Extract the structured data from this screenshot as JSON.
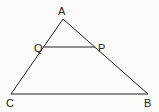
{
  "diagram": {
    "type": "triangle with parallel segment",
    "points": {
      "A": {
        "label": "A",
        "x": 63,
        "y": 19
      },
      "B": {
        "label": "B",
        "x": 148,
        "y": 94
      },
      "C": {
        "label": "C",
        "x": 11,
        "y": 94
      },
      "P": {
        "label": "P",
        "x": 95,
        "y": 47
      },
      "Q": {
        "label": "Q",
        "x": 43,
        "y": 47
      }
    },
    "segments": [
      "AB",
      "AC",
      "BC",
      "QP"
    ],
    "line_color": "#222222"
  }
}
